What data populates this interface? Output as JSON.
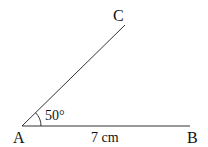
{
  "diagram": {
    "vertices": {
      "A": "A",
      "B": "B",
      "C": "C"
    },
    "angle_label": "50°",
    "side_label": "7 cm",
    "line_color": "#333333"
  }
}
